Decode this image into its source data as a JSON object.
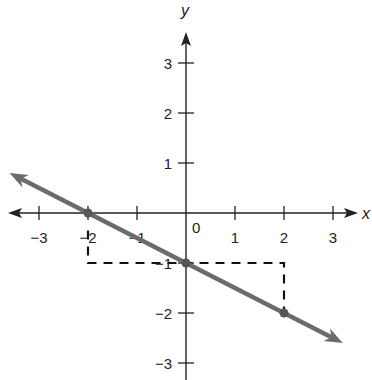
{
  "chart_data": {
    "type": "line",
    "title": "",
    "xlabel": "x",
    "ylabel": "y",
    "xlim": [
      -3.5,
      3.5
    ],
    "ylim": [
      -3.4,
      3.6
    ],
    "grid": false,
    "x_ticks": [
      -3,
      -2,
      -1,
      1,
      2,
      3
    ],
    "y_ticks": [
      -3,
      -2,
      -1,
      1,
      2,
      3
    ],
    "x_tick_labels": [
      "−3",
      "−2",
      "−1",
      "1",
      "2",
      "3"
    ],
    "y_tick_labels": [
      "−3",
      "−2",
      "−1",
      "1",
      "2",
      "3"
    ],
    "origin_label": "0",
    "series": [
      {
        "name": "line",
        "equation": "y = -x/2 - 1",
        "slope": -0.5,
        "intercept": -1,
        "x_extent": [
          -3.6,
          3.2
        ],
        "color": "#6b6b6b",
        "arrows": "both"
      }
    ],
    "points": [
      {
        "x": -2,
        "y": 0
      },
      {
        "x": 0,
        "y": -1
      },
      {
        "x": 2,
        "y": -2
      }
    ],
    "annotations": [
      {
        "type": "dashed-guide",
        "path": [
          [
            -2,
            -0.35
          ],
          [
            -2,
            -1
          ],
          [
            2,
            -1
          ],
          [
            2,
            -2
          ]
        ],
        "color": "#111111"
      }
    ]
  },
  "colors": {
    "axis": "#222222",
    "line": "#6b6b6b",
    "dash": "#111111"
  }
}
